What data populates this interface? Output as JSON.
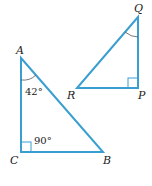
{
  "diagram": {
    "line_color": "#3a9fd0",
    "triangle_abc": {
      "vertices": {
        "A": {
          "label": "A",
          "x": 21,
          "y": 58
        },
        "B": {
          "label": "B",
          "x": 103,
          "y": 152
        },
        "C": {
          "label": "C",
          "x": 21,
          "y": 152
        }
      },
      "angle_a": "42°",
      "angle_c": "90°"
    },
    "triangle_pqr": {
      "vertices": {
        "P": {
          "label": "P",
          "x": 138,
          "y": 88
        },
        "Q": {
          "label": "Q",
          "x": 138,
          "y": 17
        },
        "R": {
          "label": "R",
          "x": 77,
          "y": 88
        }
      }
    }
  }
}
